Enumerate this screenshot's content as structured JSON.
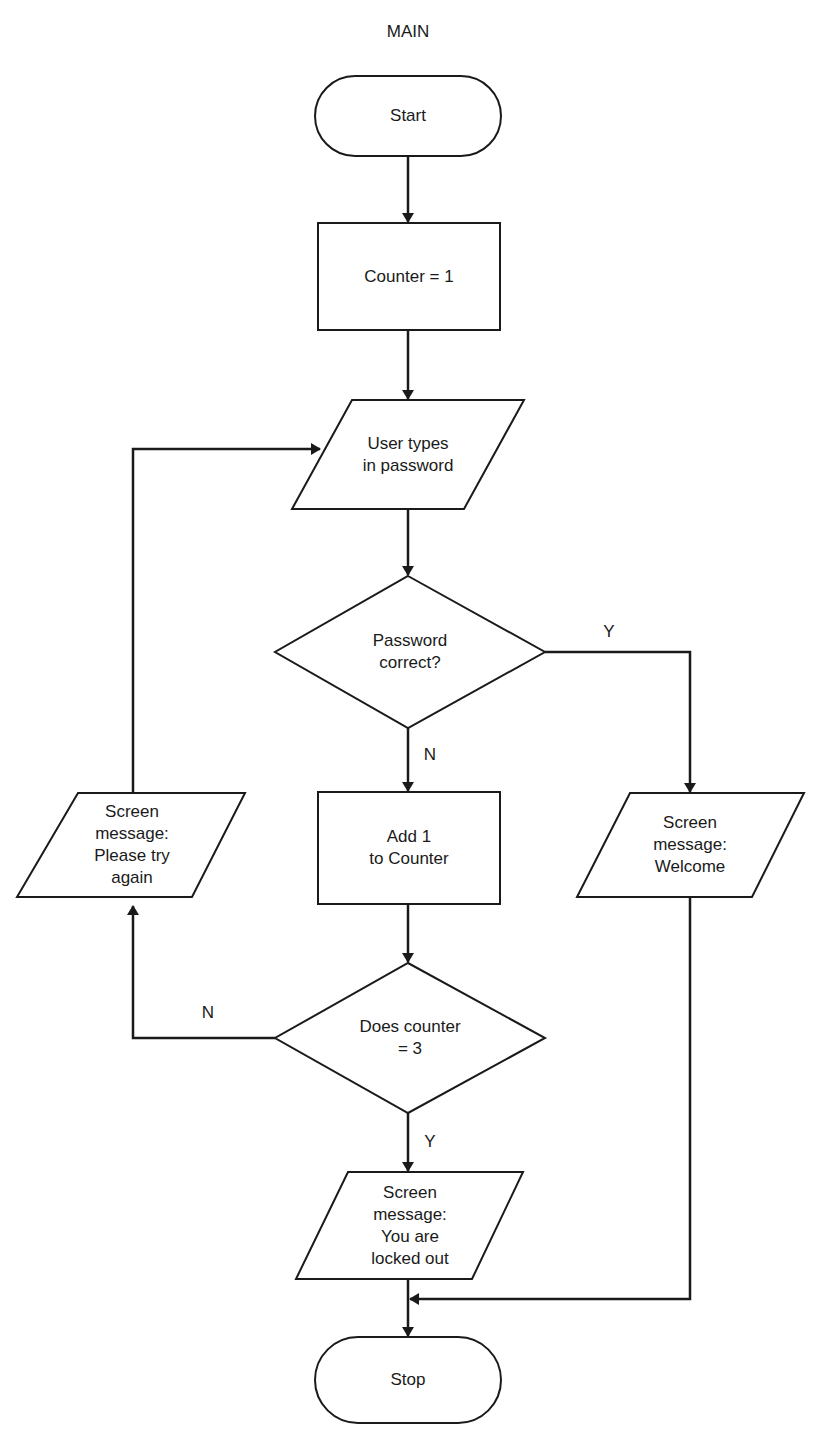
{
  "title": "MAIN",
  "nodes": {
    "start": {
      "label": "Start",
      "shape": "terminator"
    },
    "init": {
      "label": "Counter = 1",
      "shape": "process"
    },
    "input": {
      "label": "User types\nin password",
      "shape": "io"
    },
    "check_pw": {
      "label": "Password\ncorrect?",
      "shape": "decision"
    },
    "add": {
      "label": "Add 1\nto Counter",
      "shape": "process"
    },
    "check_count": {
      "label": "Does counter\n= 3",
      "shape": "decision"
    },
    "retry": {
      "label": "Screen\nmessage:\nPlease try\nagain",
      "shape": "io"
    },
    "welcome": {
      "label": "Screen\nmessage:\nWelcome",
      "shape": "io"
    },
    "locked": {
      "label": "Screen\nmessage:\nYou are\nlocked out",
      "shape": "io"
    },
    "stop": {
      "label": "Stop",
      "shape": "terminator"
    }
  },
  "edges": {
    "pw_yes": "Y",
    "pw_no": "N",
    "count_no": "N",
    "count_yes": "Y"
  },
  "colors": {
    "stroke": "#1a1a1a",
    "fill": "#ffffff"
  }
}
